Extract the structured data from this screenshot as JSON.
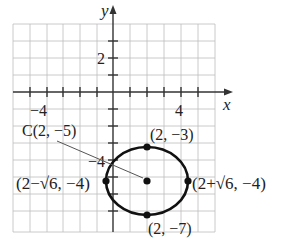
{
  "graph": {
    "axes": {
      "x_label": "x",
      "y_label": "y"
    },
    "tick_labels": {
      "x_neg4": "−4",
      "x_pos4": "4",
      "y_pos2": "2",
      "y_neg4": "−4"
    },
    "circle": {
      "center_label": "C(2, −5)",
      "top_label": "(2, −3)",
      "bottom_label": "(2, −7)",
      "left_label": "(2−√6, −4)",
      "right_label": "(2+√6, −4)"
    },
    "colors": {
      "grid": "#b5b5b5",
      "axis": "#333333",
      "curve": "#111111"
    }
  }
}
